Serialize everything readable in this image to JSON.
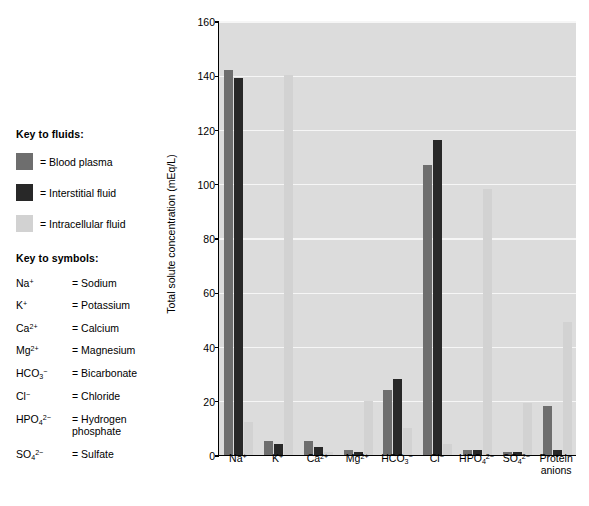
{
  "legend": {
    "fluids_title": "Key to fluids:",
    "fluids": [
      {
        "label": "= Blood plasma",
        "color": "#6e6e6e",
        "name": "blood-plasma"
      },
      {
        "label": "= Interstitial fluid",
        "color": "#282828",
        "name": "interstitial-fluid"
      },
      {
        "label": "= Intracellular fluid",
        "color": "#d2d2d2",
        "name": "intracellular-fluid"
      }
    ],
    "symbols_title": "Key to symbols:",
    "symbols": [
      {
        "formula_html": "Na<sup>+</sup>",
        "name": "= Sodium"
      },
      {
        "formula_html": "K<sup>+</sup>",
        "name": "= Potassium"
      },
      {
        "formula_html": "Ca<sup>2+</sup>",
        "name": "= Calcium"
      },
      {
        "formula_html": "Mg<sup>2+</sup>",
        "name": "= Magnesium"
      },
      {
        "formula_html": "HCO<sub>3</sub><sup>−</sup>",
        "name": "= Bicarbonate"
      },
      {
        "formula_html": "Cl<sup>−</sup>",
        "name": "= Chloride"
      },
      {
        "formula_html": "HPO<sub>4</sub><sup>2−</sup>",
        "name": "= Hydrogen\nphosphate"
      },
      {
        "formula_html": "SO<sub>4</sub><sup>2−</sup>",
        "name": "= Sulfate"
      }
    ]
  },
  "chart_data": {
    "type": "bar",
    "title": "",
    "xlabel": "",
    "ylabel": "Total solute concentration (mEq/L)",
    "ylim": [
      0,
      160
    ],
    "yticks": [
      0,
      20,
      40,
      60,
      80,
      100,
      120,
      140,
      160
    ],
    "grid": true,
    "legend_position": "outside-left",
    "categories": [
      "Na+",
      "K+",
      "Ca2+",
      "Mg2+",
      "HCO3-",
      "Cl-",
      "HPO4 2-",
      "SO4 2-",
      "Protein anions"
    ],
    "category_labels_html": [
      "Na<sup>+</sup>",
      "K<sup>+</sup>",
      "Ca<sup>2+</sup>",
      "Mg<sup>2+</sup>",
      "HCO<sub>3</sub><sup>−</sup>",
      "Cl<sup>−</sup>",
      "HPO<sub>4</sub><sup>2−</sup>",
      "SO<sub>4</sub><sup>2−</sup>",
      "Protein\nanions"
    ],
    "series": [
      {
        "name": "Blood plasma",
        "color": "#6e6e6e",
        "values": [
          142,
          5,
          5,
          2,
          24,
          107,
          2,
          1,
          18
        ]
      },
      {
        "name": "Interstitial fluid",
        "color": "#282828",
        "values": [
          139,
          4,
          3,
          1,
          28,
          116,
          2,
          1,
          2
        ]
      },
      {
        "name": "Intracellular fluid",
        "color": "#d2d2d2",
        "values": [
          12,
          140,
          1,
          20,
          10,
          4,
          98,
          19,
          49
        ]
      }
    ]
  }
}
